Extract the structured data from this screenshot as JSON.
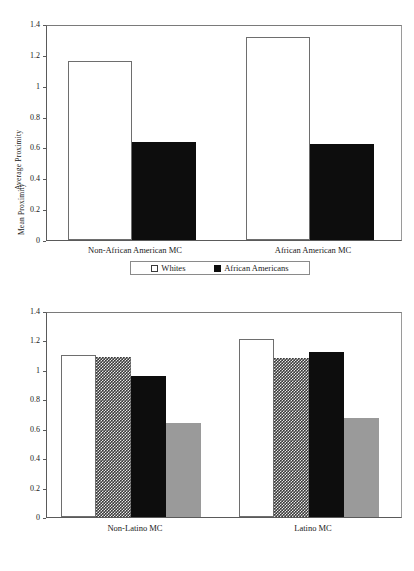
{
  "chart_data": [
    {
      "id": "top",
      "type": "bar",
      "title": "",
      "xlabel": "",
      "ylabel": "Average Proximity",
      "ylim": [
        0,
        1.4
      ],
      "yticks": [
        "0",
        "0.2",
        "0.4",
        "0.6",
        "0.8",
        "1",
        "1.2",
        "1.4"
      ],
      "ytick_values": [
        0,
        0.2,
        0.4,
        0.6,
        0.8,
        1.0,
        1.2,
        1.4
      ],
      "grid": false,
      "legend_position": "bottom",
      "categories": [
        "Non-African American MC",
        "African American MC"
      ],
      "series": [
        {
          "name": "Whites",
          "style": "white",
          "values": [
            1.17,
            1.33
          ]
        },
        {
          "name": "African Americans",
          "style": "black",
          "values": [
            0.64,
            0.63
          ]
        }
      ]
    },
    {
      "id": "bottom",
      "type": "bar",
      "title": "",
      "xlabel": "",
      "ylabel": "Mean Proximity",
      "ylim": [
        0,
        1.4
      ],
      "yticks": [
        "0",
        "0.2",
        "0.4",
        "0.6",
        "0.8",
        "1",
        "1.2",
        "1.4"
      ],
      "ytick_values": [
        0,
        0.2,
        0.4,
        0.6,
        0.8,
        1.0,
        1.2,
        1.4
      ],
      "grid": false,
      "legend_position": "bottom",
      "categories": [
        "Non-Latino MC",
        "Latino MC"
      ],
      "series": [
        {
          "name": "Whites (Economic Security)",
          "style": "white",
          "values": [
            1.11,
            1.22
          ]
        },
        {
          "name": "Latinos (Economic Security)",
          "style": "hatch",
          "values": [
            1.1,
            1.09
          ]
        },
        {
          "name": "Whites (Education)",
          "style": "black",
          "values": [
            0.97,
            1.13
          ]
        },
        {
          "name": "Latinos (Education)",
          "style": "gray",
          "values": [
            0.645,
            0.68
          ]
        }
      ]
    }
  ]
}
